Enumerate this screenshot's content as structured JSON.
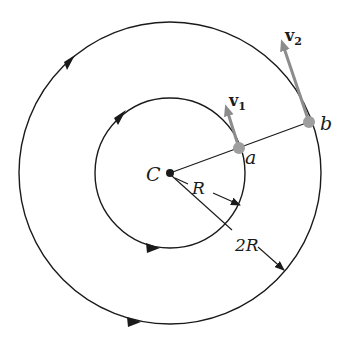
{
  "diagram": {
    "type": "concentric-circular-motion",
    "center_label": "C",
    "inner_radius_label": "R",
    "outer_radius_label": "2R",
    "point_inner_label": "a",
    "point_outer_label": "b",
    "velocity_inner": {
      "symbol": "v",
      "subscript": "1"
    },
    "velocity_outer": {
      "symbol": "v",
      "subscript": "2"
    },
    "rotation_direction": "counterclockwise",
    "colors": {
      "line": "#1a1a1a",
      "vector": "#8c8c8c",
      "point": "#9e9e9e",
      "background": "#ffffff"
    }
  }
}
